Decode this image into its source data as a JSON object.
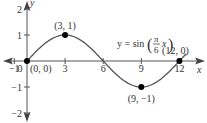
{
  "chart_data": {
    "type": "line",
    "title": "",
    "equation_label": "y = sin(π/6 x)",
    "equation_parts": {
      "prefix": "y = sin",
      "num": "π",
      "den": "6",
      "var": "x"
    },
    "xlabel": "x",
    "ylabel": "y",
    "xlim": [
      -1,
      13
    ],
    "ylim": [
      -2,
      2
    ],
    "x_ticks": [
      {
        "value": -1,
        "label": "−1"
      },
      {
        "value": 0,
        "label": "0"
      },
      {
        "value": 3,
        "label": "3"
      },
      {
        "value": 6,
        "label": "6"
      },
      {
        "value": 9,
        "label": "9"
      },
      {
        "value": 12,
        "label": "12"
      }
    ],
    "y_ticks": [
      {
        "value": 2,
        "label": "2"
      },
      {
        "value": 1,
        "label": "1"
      },
      {
        "value": -1,
        "label": "−1"
      },
      {
        "value": -2,
        "label": "−2"
      }
    ],
    "series": [
      {
        "name": "y = sin(πx/6)",
        "x": [
          0,
          1,
          2,
          3,
          4,
          5,
          6,
          7,
          8,
          9,
          10,
          11,
          12
        ],
        "values": [
          0,
          0.5,
          0.866,
          1,
          0.866,
          0.5,
          0,
          -0.5,
          -0.866,
          -1,
          -0.866,
          -0.5,
          0
        ]
      }
    ],
    "points": [
      {
        "x": 0,
        "y": 0,
        "label": "(0, 0)"
      },
      {
        "x": 3,
        "y": 1,
        "label": "(3, 1)"
      },
      {
        "x": 9,
        "y": -1,
        "label": "(9, −1)"
      },
      {
        "x": 12,
        "y": 0,
        "label": "(12, 0)"
      }
    ],
    "grid": false,
    "legend": "none"
  },
  "colors": {
    "axis": "#555555",
    "curve": "#555555",
    "point": "#000000",
    "text": "#333333"
  }
}
